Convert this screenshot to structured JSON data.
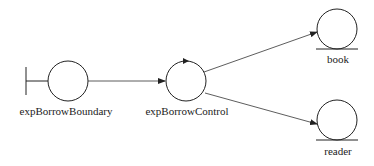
{
  "diagram": {
    "type": "uml-robustness-diagram",
    "nodes": [
      {
        "id": "expBorrowBoundary",
        "kind": "boundary",
        "label": "expBorrowBoundary",
        "cx": 68,
        "cy": 81,
        "r": 20
      },
      {
        "id": "expBorrowControl",
        "kind": "control",
        "label": "expBorrowControl",
        "cx": 186,
        "cy": 81,
        "r": 20
      },
      {
        "id": "book",
        "kind": "entity",
        "label": "book",
        "cx": 337,
        "cy": 29,
        "r": 20
      },
      {
        "id": "reader",
        "kind": "entity",
        "label": "reader",
        "cx": 337,
        "cy": 120,
        "r": 20
      }
    ],
    "edges": [
      {
        "from": "expBorrowBoundary",
        "to": "expBorrowControl"
      },
      {
        "from": "expBorrowControl",
        "to": "book"
      },
      {
        "from": "expBorrowControl",
        "to": "reader"
      }
    ],
    "colors": {
      "stroke": "#222222",
      "background": "#ffffff"
    }
  }
}
